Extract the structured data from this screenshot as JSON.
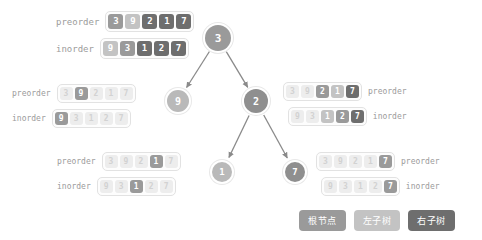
{
  "labels": {
    "preorder": "preorder",
    "inorder": "inorder"
  },
  "groups": {
    "top": {
      "preorder": [
        {
          "v": "3",
          "shade": "root"
        },
        {
          "v": "9",
          "shade": "left"
        },
        {
          "v": "2",
          "shade": "right"
        },
        {
          "v": "1",
          "shade": "right"
        },
        {
          "v": "7",
          "shade": "right"
        }
      ],
      "inorder": [
        {
          "v": "9",
          "shade": "left"
        },
        {
          "v": "3",
          "shade": "root"
        },
        {
          "v": "1",
          "shade": "right"
        },
        {
          "v": "2",
          "shade": "right"
        },
        {
          "v": "7",
          "shade": "right"
        }
      ]
    },
    "left_mid": {
      "preorder": [
        {
          "v": "3",
          "shade": "dim"
        },
        {
          "v": "9",
          "shade": "root"
        },
        {
          "v": "2",
          "shade": "dim"
        },
        {
          "v": "1",
          "shade": "dim"
        },
        {
          "v": "7",
          "shade": "dim"
        }
      ],
      "inorder": [
        {
          "v": "9",
          "shade": "root"
        },
        {
          "v": "3",
          "shade": "dim"
        },
        {
          "v": "1",
          "shade": "dim"
        },
        {
          "v": "2",
          "shade": "dim"
        },
        {
          "v": "7",
          "shade": "dim"
        }
      ]
    },
    "right_mid": {
      "preorder": [
        {
          "v": "3",
          "shade": "dim"
        },
        {
          "v": "9",
          "shade": "dim"
        },
        {
          "v": "2",
          "shade": "root"
        },
        {
          "v": "1",
          "shade": "left"
        },
        {
          "v": "7",
          "shade": "right"
        }
      ],
      "inorder": [
        {
          "v": "9",
          "shade": "dim"
        },
        {
          "v": "3",
          "shade": "dim"
        },
        {
          "v": "1",
          "shade": "left"
        },
        {
          "v": "2",
          "shade": "root"
        },
        {
          "v": "7",
          "shade": "right"
        }
      ]
    },
    "bottom_left": {
      "preorder": [
        {
          "v": "3",
          "shade": "dim"
        },
        {
          "v": "9",
          "shade": "dim"
        },
        {
          "v": "2",
          "shade": "dim"
        },
        {
          "v": "1",
          "shade": "root"
        },
        {
          "v": "7",
          "shade": "dim"
        }
      ],
      "inorder": [
        {
          "v": "9",
          "shade": "dim"
        },
        {
          "v": "3",
          "shade": "dim"
        },
        {
          "v": "1",
          "shade": "root"
        },
        {
          "v": "2",
          "shade": "dim"
        },
        {
          "v": "7",
          "shade": "dim"
        }
      ]
    },
    "bottom_right": {
      "preorder": [
        {
          "v": "3",
          "shade": "dim"
        },
        {
          "v": "9",
          "shade": "dim"
        },
        {
          "v": "2",
          "shade": "dim"
        },
        {
          "v": "1",
          "shade": "dim"
        },
        {
          "v": "7",
          "shade": "root"
        }
      ],
      "inorder": [
        {
          "v": "9",
          "shade": "dim"
        },
        {
          "v": "3",
          "shade": "dim"
        },
        {
          "v": "1",
          "shade": "dim"
        },
        {
          "v": "2",
          "shade": "dim"
        },
        {
          "v": "7",
          "shade": "root"
        }
      ]
    }
  },
  "tree": {
    "nodes": [
      {
        "id": "root",
        "value": "3",
        "x": 218,
        "y": 38,
        "role": "root"
      },
      {
        "id": "left",
        "value": "9",
        "x": 178,
        "y": 101,
        "role": "left"
      },
      {
        "id": "right",
        "value": "2",
        "x": 256,
        "y": 101,
        "role": "right"
      },
      {
        "id": "leaf-l",
        "value": "1",
        "x": 222,
        "y": 172,
        "role": "leaf-l"
      },
      {
        "id": "leaf-r",
        "value": "7",
        "x": 295,
        "y": 172,
        "role": "leaf-r"
      }
    ],
    "edges": [
      {
        "from": "root",
        "to": "left"
      },
      {
        "from": "root",
        "to": "right"
      },
      {
        "from": "right",
        "to": "leaf-l"
      },
      {
        "from": "right",
        "to": "leaf-r"
      }
    ],
    "edge_color": "#8a8a8a"
  },
  "legend": [
    {
      "label": "根节点",
      "shade": "root"
    },
    {
      "label": "左子树",
      "shade": "left"
    },
    {
      "label": "右子树",
      "shade": "right"
    }
  ],
  "colors": {
    "root": "#9a9a9a",
    "left": "#c3c3c3",
    "right": "#6e6e6e",
    "dim": "#ededed",
    "label_text": "#9b9b9b",
    "box_border": "#e2e2e2"
  }
}
